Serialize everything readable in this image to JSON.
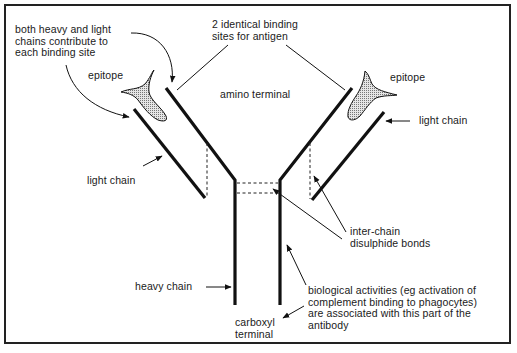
{
  "diagram": {
    "labels": {
      "both_chains_contribute": "both heavy and light\nchains contribute to\neach binding site",
      "binding_sites": "2 identical binding\nsites for antigen",
      "epitope_left": "epitope",
      "epitope_right": "epitope",
      "amino_terminal": "amino terminal",
      "light_chain_left": "light chain",
      "light_chain_right": "light chain",
      "inter_chain_bonds": "inter-chain\ndisulphide bonds",
      "heavy_chain": "heavy chain",
      "carboxyl_terminal": "carboxyl\nterminal",
      "biological_activities": "biological activities (eg activation of\ncomplement binding to phagocytes)\nare associated with this part of the\nantibody"
    },
    "colors": {
      "line": "#111111",
      "epitope_fill": "#bdbdbd",
      "background": "#ffffff"
    }
  }
}
